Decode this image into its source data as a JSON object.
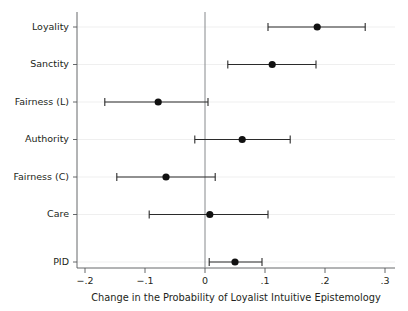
{
  "chart_data": {
    "type": "scatter",
    "title": "",
    "subtitle": "",
    "xlabel": "Change in the Probability of Loyalist Intuitive Epistemology",
    "ylabel": "",
    "xlim": [
      -0.22,
      0.31
    ],
    "xticks": [
      -0.2,
      -0.1,
      0,
      0.1,
      0.2,
      0.3
    ],
    "xticklabels": [
      "−.2",
      "−.1",
      "0",
      ".1",
      ".2",
      ".3"
    ],
    "grid": "horizontal",
    "legend": "none",
    "reference_line_x": 0,
    "categories": [
      "Loyality",
      "Sanctity",
      "Fairness (L)",
      "Authority",
      "Fairness (C)",
      "Care",
      "PID"
    ],
    "points": [
      {
        "label": "Loyality",
        "estimate": 0.187,
        "ci_low": 0.105,
        "ci_high": 0.267
      },
      {
        "label": "Sanctity",
        "estimate": 0.112,
        "ci_low": 0.038,
        "ci_high": 0.185
      },
      {
        "label": "Fairness (L)",
        "estimate": -0.078,
        "ci_low": -0.167,
        "ci_high": 0.005
      },
      {
        "label": "Authority",
        "estimate": 0.062,
        "ci_low": -0.017,
        "ci_high": 0.142
      },
      {
        "label": "Fairness (C)",
        "estimate": -0.065,
        "ci_low": -0.147,
        "ci_high": 0.017
      },
      {
        "label": "Care",
        "estimate": 0.008,
        "ci_low": -0.093,
        "ci_high": 0.105
      },
      {
        "label": "PID",
        "estimate": 0.05,
        "ci_low": 0.007,
        "ci_high": 0.095
      }
    ],
    "colors": {
      "point": "#111111",
      "interval": "#2b2b2b",
      "axis": "#55585a",
      "grid": "#e8e8e8",
      "zero_reference": "#86898c",
      "background": "#ffffff",
      "text": "#231f20"
    }
  }
}
